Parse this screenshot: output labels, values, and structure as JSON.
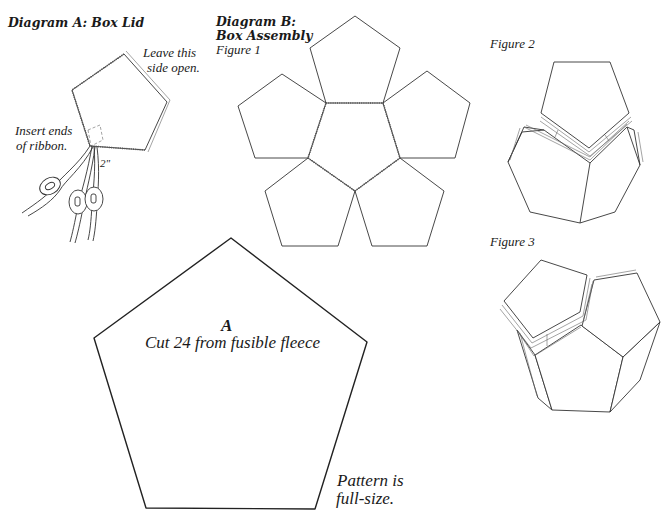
{
  "page": {
    "top_strip_text": "",
    "background": "#ffffff",
    "line_color": "#333333"
  },
  "diagram_a": {
    "title": "Diagram A: Box Lid",
    "callouts": {
      "open_side_line1": "Leave this",
      "open_side_line2": "side open.",
      "ribbon_line1": "Insert ends",
      "ribbon_line2": "of ribbon.",
      "measure": "2\""
    },
    "icons": [
      "pentagon-lid-icon",
      "ribbon-icon",
      "button-toggle-icon"
    ]
  },
  "diagram_b": {
    "title_line1": "Diagram B:",
    "title_line2": "Box Assembly",
    "figures": [
      {
        "label": "Figure 1",
        "description": "six pentagons joined around a central pentagon, stitched seams"
      },
      {
        "label": "Figure 2",
        "description": "partial box with a pentagon being inserted"
      },
      {
        "label": "Figure 3",
        "description": "box nearly closed with lid pentagon"
      }
    ]
  },
  "pattern_a": {
    "letter": "A",
    "instruction": "Cut 24 from fusible fleece",
    "note_line1": "Pattern is",
    "note_line2": "full-size."
  }
}
